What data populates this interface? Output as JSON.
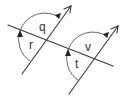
{
  "diagram": {
    "type": "parallel-lines-transversal",
    "labels": {
      "q": "q",
      "r": "r",
      "v": "v",
      "t": "t"
    },
    "colors": {
      "line": "#3a3a3a",
      "arc": "#555555",
      "arrowhead": "#222222",
      "background": "#ffffff"
    }
  }
}
